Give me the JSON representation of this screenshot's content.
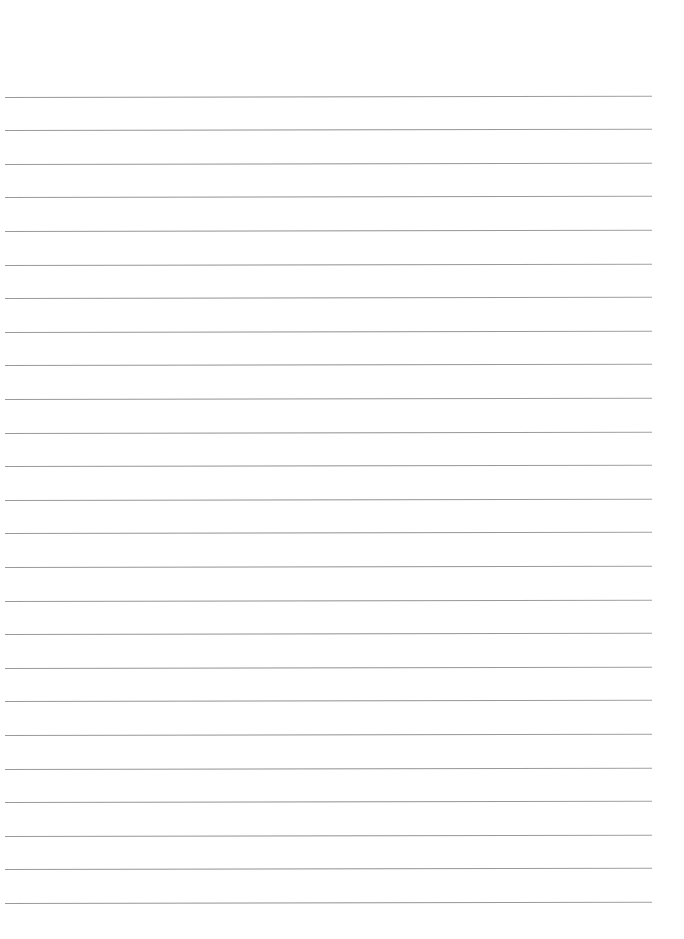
{
  "document": {
    "type": "lined-paper",
    "text": "",
    "line_count": 25,
    "line_color": "#979797",
    "background_color": "#ffffff",
    "lines_y": [
      97,
      130,
      164,
      197,
      231,
      265,
      298,
      332,
      365,
      399,
      433,
      466,
      500,
      533,
      567,
      601,
      634,
      668,
      701,
      735,
      769,
      802,
      836,
      869,
      903
    ]
  }
}
